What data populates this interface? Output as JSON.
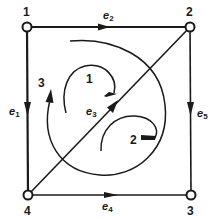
{
  "diagram": {
    "type": "directed-graph",
    "nodes": [
      {
        "id": "1",
        "label": "1",
        "x": 27,
        "y": 27
      },
      {
        "id": "2",
        "label": "2",
        "x": 190,
        "y": 27
      },
      {
        "id": "3",
        "label": "3",
        "x": 191,
        "y": 195
      },
      {
        "id": "4",
        "label": "4",
        "x": 28,
        "y": 195
      }
    ],
    "edges": [
      {
        "id": "e1",
        "label": "e",
        "sub": "1",
        "from": "1",
        "to": "4"
      },
      {
        "id": "e2",
        "label": "e",
        "sub": "2",
        "from": "1",
        "to": "2"
      },
      {
        "id": "e3",
        "label": "e",
        "sub": "3",
        "from": "4",
        "to": "2"
      },
      {
        "id": "e4",
        "label": "e",
        "sub": "4",
        "from": "4",
        "to": "3"
      },
      {
        "id": "e5",
        "label": "e",
        "sub": "5",
        "from": "2",
        "to": "3"
      }
    ],
    "loops": [
      {
        "id": "loop1",
        "label": "1"
      },
      {
        "id": "loop2",
        "label": "2"
      },
      {
        "id": "loop3",
        "label": "3"
      }
    ],
    "colors": {
      "stroke": "#1a1a1a",
      "background": "#ffffff"
    }
  }
}
